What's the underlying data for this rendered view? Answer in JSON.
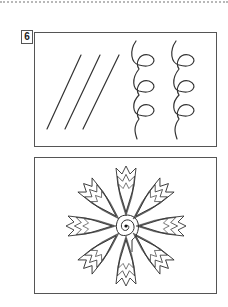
{
  "worksheet": {
    "exercise_number": "6",
    "panels": [
      {
        "name": "tracing-lines-panel",
        "content": [
          "3 diagonal lines",
          "2 loop coils with 3 loops each"
        ]
      },
      {
        "name": "flower-maze-panel",
        "content": [
          "8-petal flower outline with triple lines",
          "central spiral"
        ]
      }
    ],
    "colors": {
      "line": "#333333",
      "border": "#555555",
      "dots": "#b8b8b8"
    }
  }
}
